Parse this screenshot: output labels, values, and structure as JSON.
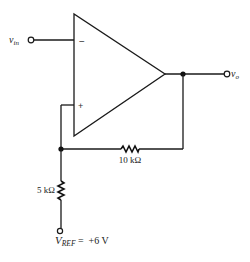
{
  "diagram": {
    "type": "inverting comparator / Schmitt trigger circuit",
    "colors": {
      "line": "#1a1a1a",
      "background": "#ffffff"
    },
    "labels": {
      "vin_main": "v",
      "vin_sub": "in",
      "vo_main": "v",
      "vo_sub": "o",
      "inverting_sign": "−",
      "noninverting_sign": "+",
      "r_feedback": "10 kΩ",
      "r_ground": "5 kΩ",
      "vref_main": "V",
      "vref_sub": "REF",
      "vref_value": " =  +6 V"
    },
    "components": [
      {
        "id": "opamp",
        "kind": "operational amplifier"
      },
      {
        "id": "r_feedback",
        "kind": "resistor",
        "value": "10 kΩ",
        "between": [
          "output",
          "non-inverting input"
        ]
      },
      {
        "id": "r_ground",
        "kind": "resistor",
        "value": "5 kΩ",
        "between": [
          "non-inverting input",
          "V_REF"
        ]
      }
    ],
    "terminals": [
      "v_in",
      "v_o",
      "V_REF"
    ]
  }
}
